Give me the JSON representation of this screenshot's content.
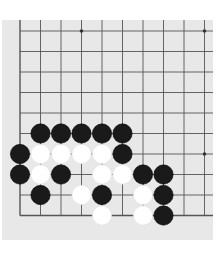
{
  "board": {
    "background": "#e8e8e8",
    "line_color": "#555555",
    "visible_cols": 10,
    "visible_rows": 10,
    "origin_x": 20,
    "origin_y": 31,
    "spacing": 20.5,
    "region": {
      "left": 2,
      "top": 20,
      "right": 213,
      "bottom": 240
    },
    "edges": {
      "left": true,
      "bottom": true,
      "top": false,
      "right": false
    },
    "star_points": [
      {
        "col": 3,
        "row": 0
      },
      {
        "col": 9,
        "row": 0
      },
      {
        "col": 9,
        "row": 6
      }
    ]
  },
  "stones": [
    {
      "color": "black",
      "col": 1,
      "row": 5
    },
    {
      "color": "black",
      "col": 2,
      "row": 5
    },
    {
      "color": "black",
      "col": 3,
      "row": 5
    },
    {
      "color": "black",
      "col": 4,
      "row": 5
    },
    {
      "color": "black",
      "col": 5,
      "row": 5
    },
    {
      "color": "black",
      "col": 0,
      "row": 6
    },
    {
      "color": "white",
      "col": 1,
      "row": 6
    },
    {
      "color": "white",
      "col": 2,
      "row": 6
    },
    {
      "color": "white",
      "col": 3,
      "row": 6
    },
    {
      "color": "white",
      "col": 4,
      "row": 6
    },
    {
      "color": "black",
      "col": 5,
      "row": 6
    },
    {
      "color": "black",
      "col": 0,
      "row": 7
    },
    {
      "color": "white",
      "col": 1,
      "row": 7
    },
    {
      "color": "black",
      "col": 2,
      "row": 7
    },
    {
      "color": "white",
      "col": 4,
      "row": 7
    },
    {
      "color": "white",
      "col": 5,
      "row": 7
    },
    {
      "color": "black",
      "col": 6,
      "row": 7
    },
    {
      "color": "black",
      "col": 7,
      "row": 7
    },
    {
      "color": "black",
      "col": 1,
      "row": 8
    },
    {
      "color": "white",
      "col": 3,
      "row": 8
    },
    {
      "color": "black",
      "col": 4,
      "row": 8
    },
    {
      "color": "white",
      "col": 6,
      "row": 8
    },
    {
      "color": "black",
      "col": 7,
      "row": 8
    },
    {
      "color": "white",
      "col": 4,
      "row": 9
    },
    {
      "color": "white",
      "col": 6,
      "row": 9
    },
    {
      "color": "black",
      "col": 7,
      "row": 9
    }
  ],
  "colors": {
    "black_stone": "#1a1a1a",
    "white_stone": "#ffffff",
    "page_background": "#ffffff"
  }
}
